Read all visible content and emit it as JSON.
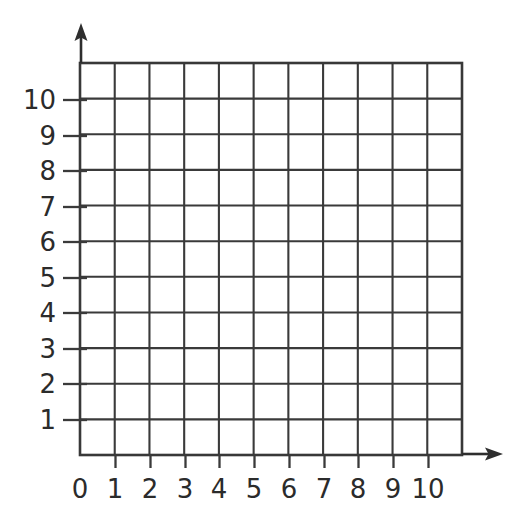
{
  "figure": {
    "kind": "blank-coordinate-grid",
    "background_color": "#ffffff",
    "line_color": "#3a3a3a",
    "label_color": "#2b2b2b"
  },
  "chart_data": {
    "type": "scatter",
    "title": "",
    "subtitle": "",
    "xlabel": "",
    "ylabel": "",
    "grid": true,
    "legend": null,
    "legend_position": "none",
    "series": [],
    "values": [],
    "x": [],
    "categories": [],
    "xlim": [
      0,
      11
    ],
    "ylim": [
      0,
      11
    ],
    "x_tick_labels": [
      "0",
      "1",
      "2",
      "3",
      "4",
      "5",
      "6",
      "7",
      "8",
      "9",
      "10"
    ],
    "x_tick_values": [
      0,
      1,
      2,
      3,
      4,
      5,
      6,
      7,
      8,
      9,
      10
    ],
    "y_tick_labels": [
      "10",
      "9",
      "8",
      "7",
      "6",
      "5",
      "4",
      "3",
      "2",
      "1"
    ],
    "y_tick_values": [
      10,
      9,
      8,
      7,
      6,
      5,
      4,
      3,
      2,
      1
    ],
    "grid_columns": 11,
    "grid_rows": 11,
    "annotations": [],
    "axis_arrows": [
      "x-axis-arrow-right",
      "y-axis-arrow-up"
    ]
  },
  "axes": {
    "x_axis": {
      "name": "x-axis",
      "arrow_icon": "arrow-right-icon",
      "labels": [
        {
          "text": "0",
          "value": 0,
          "px": 80
        },
        {
          "text": "1",
          "value": 1,
          "px": 115
        },
        {
          "text": "2",
          "value": 2,
          "px": 150
        },
        {
          "text": "3",
          "value": 3,
          "px": 185
        },
        {
          "text": "4",
          "value": 4,
          "px": 219
        },
        {
          "text": "5",
          "value": 5,
          "px": 254
        },
        {
          "text": "6",
          "value": 6,
          "px": 289
        },
        {
          "text": "7",
          "value": 7,
          "px": 324
        },
        {
          "text": "8",
          "value": 8,
          "px": 358
        },
        {
          "text": "9",
          "value": 9,
          "px": 393
        },
        {
          "text": "10",
          "value": 10,
          "px": 428
        }
      ]
    },
    "y_axis": {
      "name": "y-axis",
      "arrow_icon": "arrow-up-icon",
      "labels": [
        {
          "text": "10",
          "value": 10,
          "px": 100
        },
        {
          "text": "9",
          "value": 9,
          "px": 136
        },
        {
          "text": "8",
          "value": 8,
          "px": 171
        },
        {
          "text": "7",
          "value": 7,
          "px": 207
        },
        {
          "text": "6",
          "value": 6,
          "px": 242
        },
        {
          "text": "5",
          "value": 5,
          "px": 278
        },
        {
          "text": "4",
          "value": 4,
          "px": 313
        },
        {
          "text": "3",
          "value": 3,
          "px": 349
        },
        {
          "text": "2",
          "value": 2,
          "px": 384
        },
        {
          "text": "1",
          "value": 1,
          "px": 420
        }
      ]
    }
  }
}
